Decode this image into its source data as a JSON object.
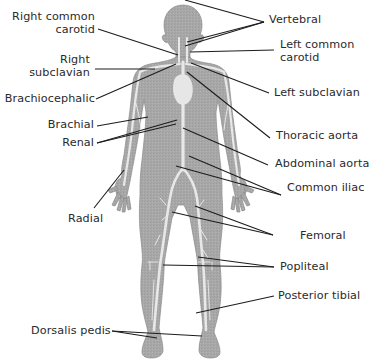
{
  "diagram": {
    "type": "anatomical-diagram",
    "colors": {
      "body_fill": "#a9a9a9",
      "vessel_fill": "#e6e6e6",
      "leader_line": "#1c1c1c",
      "text": "#2a2a2a",
      "background": "#ffffff"
    },
    "labels_left": [
      {
        "id": "right-common-carotid",
        "line1": "Right common",
        "line2": "carotid"
      },
      {
        "id": "right-subclavian",
        "line1": "Right",
        "line2": "subclavian"
      },
      {
        "id": "brachiocephalic",
        "line1": "Brachiocephalic"
      },
      {
        "id": "brachial",
        "line1": "Brachial"
      },
      {
        "id": "renal",
        "line1": "Renal"
      },
      {
        "id": "radial",
        "line1": "Radial"
      },
      {
        "id": "dorsalis-pedis",
        "line1": "Dorsalis pedis"
      }
    ],
    "labels_right": [
      {
        "id": "vertebral",
        "line1": "Vertebral"
      },
      {
        "id": "left-common-carotid",
        "line1": "Left common",
        "line2": "carotid"
      },
      {
        "id": "left-subclavian",
        "line1": "Left subclavian"
      },
      {
        "id": "thoracic-aorta",
        "line1": "Thoracic aorta"
      },
      {
        "id": "abdominal-aorta",
        "line1": "Abdominal aorta"
      },
      {
        "id": "common-iliac",
        "line1": "Common iliac"
      },
      {
        "id": "femoral",
        "line1": "Femoral"
      },
      {
        "id": "popliteal",
        "line1": "Popliteal"
      },
      {
        "id": "posterior-tibial",
        "line1": "Posterior tibial"
      }
    ]
  }
}
